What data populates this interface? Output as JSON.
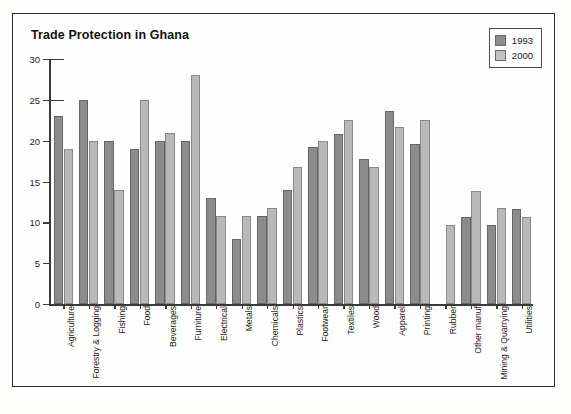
{
  "figure": {
    "title": "Trade Protection in Ghana"
  },
  "legend": {
    "position": "top-right",
    "entries": [
      {
        "label": "1993",
        "color": "#8c8c8c"
      },
      {
        "label": "2000",
        "color": "#c2c2c2"
      }
    ]
  },
  "chart_data": {
    "type": "bar",
    "title": "Trade Protection in Ghana",
    "xlabel": "",
    "ylabel": "",
    "ylim": [
      0,
      30
    ],
    "yticks": [
      0,
      5,
      10,
      15,
      20,
      25,
      30
    ],
    "grid": false,
    "legend_position": "top-right",
    "categories": [
      "Agriculture",
      "Forestry & Logging",
      "Fishing",
      "Food",
      "Beverages",
      "Furniture",
      "Electrical",
      "Metals",
      "Chemicals",
      "Plastics",
      "Footwear",
      "Textiles",
      "Wood",
      "Apparel",
      "Printing",
      "Rubber",
      "Other manuf",
      "Mining & Quarrying",
      "Utilities"
    ],
    "series": [
      {
        "name": "1993",
        "color": "#8c8c8c",
        "values": [
          23,
          25,
          20,
          19,
          20,
          20,
          13,
          8,
          10.8,
          14,
          19.2,
          20.8,
          17.7,
          23.6,
          19.6,
          null,
          10.6,
          9.7,
          11.6
        ]
      },
      {
        "name": "2000",
        "color": "#c2c2c2",
        "values": [
          19,
          20,
          14,
          25,
          21,
          28,
          10.8,
          10.8,
          11.8,
          16.8,
          20,
          22.5,
          16.8,
          21.7,
          22.5,
          9.7,
          13.8,
          11.7,
          10.7
        ]
      }
    ]
  }
}
